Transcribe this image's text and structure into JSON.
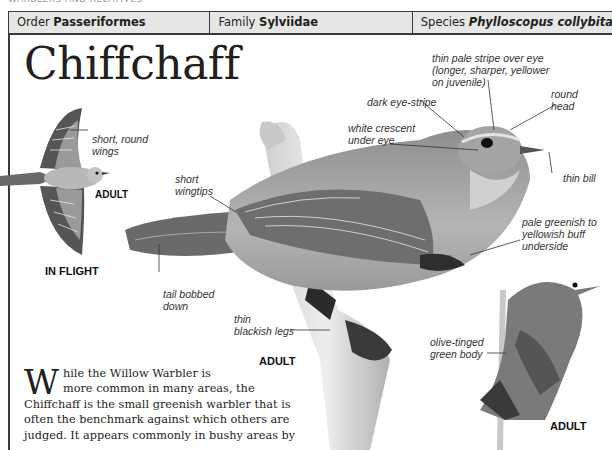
{
  "page_header_fragment": "WARBLERS AND RELATIVES",
  "header": {
    "order_label": "Order",
    "order_value": "Passeriformes",
    "family_label": "Family",
    "family_value": "Sylviidae",
    "species_label": "Species",
    "species_value": "Phylloscopus collybita"
  },
  "title": "Chiffchaff",
  "annotations": {
    "short_round_wings": "short, round\nwings",
    "short_wingtips": "short\nwingtips",
    "tail_bobbed_down": "tail bobbed\ndown",
    "thin_blackish_legs": "thin\nblackish legs",
    "dark_eye_stripe": "dark eye-stripe",
    "white_crescent": "white crescent\nunder eye",
    "pale_stripe": "thin pale stripe over eye\n(longer, sharper, yellower\non juvenile)",
    "round_head": "round\nhead",
    "thin_bill": "thin bill",
    "underside": "pale greenish to\nyellowish buff\nunderside",
    "olive_body": "olive-tinged\ngreen body"
  },
  "image_tags": {
    "flight_adult": "ADULT",
    "in_flight": "IN FLIGHT",
    "main_adult": "ADULT",
    "small_adult": "ADULT"
  },
  "body": {
    "dropcap": "W",
    "line1": "hile the Willow Warbler is",
    "line2": "more common in many areas, the",
    "rest": "Chiffchaff is the small greenish warbler that is often the benchmark against which others are judged. It appears commonly in bushy areas by"
  }
}
